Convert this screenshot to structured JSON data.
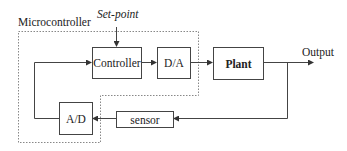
{
  "diagram": {
    "type": "block-diagram",
    "group_label": "Microcontroller",
    "inputs": {
      "setpoint": "Set-point"
    },
    "outputs": {
      "output": "Output"
    },
    "blocks": {
      "controller": "Controller",
      "da": "D/A",
      "plant": "Plant",
      "ad": "A/D",
      "sensor": "sensor"
    },
    "connections": [
      {
        "from": "Set-point",
        "to": "Controller"
      },
      {
        "from": "Controller",
        "to": "D/A"
      },
      {
        "from": "D/A",
        "to": "Plant"
      },
      {
        "from": "Plant",
        "to": "Output"
      },
      {
        "from": "Output",
        "to": "sensor"
      },
      {
        "from": "sensor",
        "to": "A/D"
      },
      {
        "from": "A/D",
        "to": "Controller"
      }
    ],
    "colors": {
      "line": "#444444",
      "text": "#222222",
      "dashed_border": "#888888",
      "background": "#ffffff"
    }
  }
}
